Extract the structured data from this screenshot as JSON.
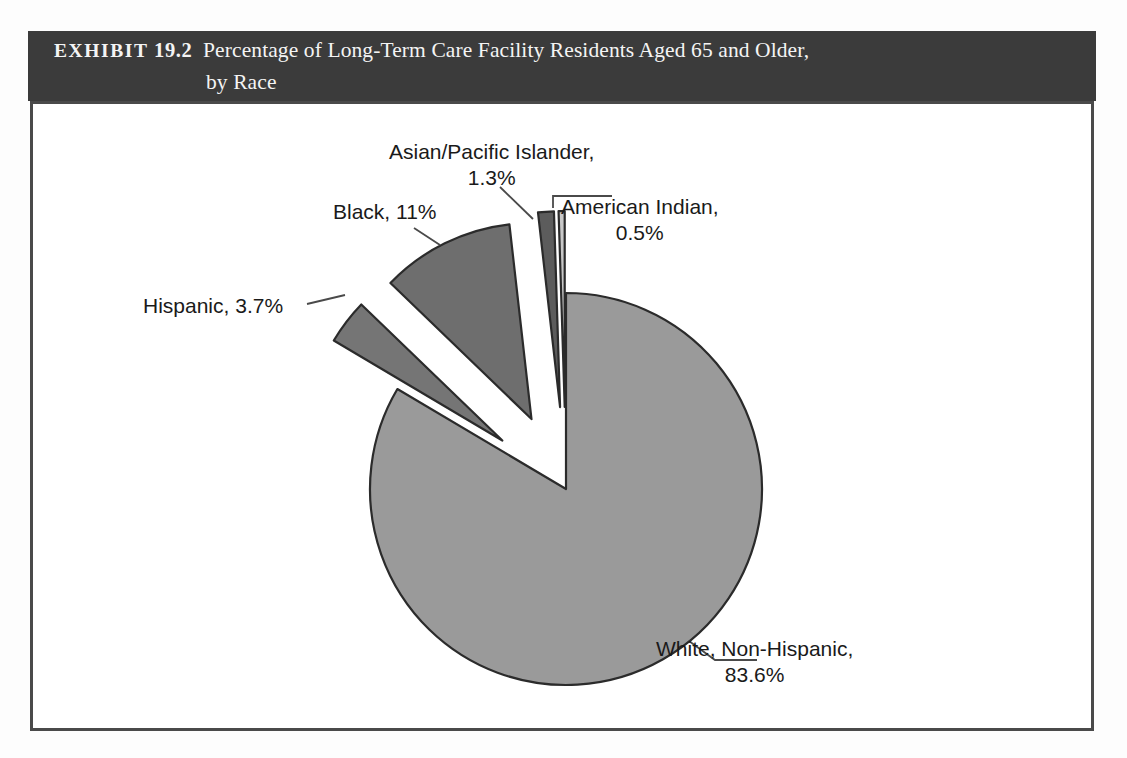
{
  "exhibit": {
    "label": "EXHIBIT",
    "number": "19.2",
    "caption_line_1": "Percentage of Long-Term Care Facility Residents Aged 65 and Older,",
    "caption_line_2": "by Race",
    "band_color": "#3b3b3b",
    "band_text_color": "#ffffff"
  },
  "labels": {
    "hispanic": "Hispanic, 3.7%",
    "black": "Black, 11%",
    "asian_line_1": "Asian/Pacific Islander,",
    "asian_line_2": "1.3%",
    "american_indian_line_1": "American Indian,",
    "american_indian_line_2": "0.5%",
    "white_line_1": "White, Non-Hispanic,",
    "white_line_2": "83.6%"
  },
  "chart_data": {
    "type": "pie",
    "title": "Percentage of Long-Term Care Facility Residents Aged 65 and Older, by Race",
    "xlabel": "",
    "ylabel": "",
    "legend": "none",
    "grid": false,
    "units": "percent",
    "categories": [
      "White, Non-Hispanic",
      "Black",
      "Hispanic",
      "Asian/Pacific Islander",
      "American Indian"
    ],
    "values": [
      83.6,
      11,
      3.7,
      1.3,
      0.5
    ],
    "slices": [
      {
        "name": "White, Non-Hispanic",
        "value": 83.6,
        "label": "White, Non-Hispanic, 83.6%",
        "color": "#9a9a9a",
        "exploded": false
      },
      {
        "name": "Black",
        "value": 11,
        "label": "Black, 11%",
        "color": "#6e6e6e",
        "exploded": true
      },
      {
        "name": "Hispanic",
        "value": 3.7,
        "label": "Hispanic, 3.7%",
        "color": "#757575",
        "exploded": true
      },
      {
        "name": "Asian/Pacific Islander",
        "value": 1.3,
        "label": "Asian/Pacific Islander, 1.3%",
        "color": "#5c5c5c",
        "exploded": true
      },
      {
        "name": "American Indian",
        "value": 0.5,
        "label": "American Indian, 0.5%",
        "color": "#c8c8c8",
        "exploded": true
      }
    ],
    "outline_color": "#2b2b2b",
    "background": "#ffffff"
  }
}
